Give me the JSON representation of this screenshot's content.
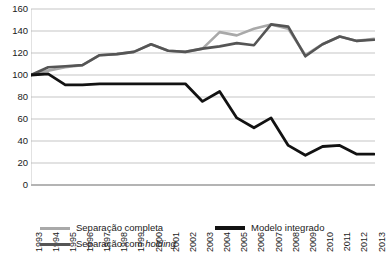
{
  "chart_data": {
    "type": "line",
    "title": "",
    "xlabel": "",
    "ylabel": "",
    "ylim": [
      0,
      160
    ],
    "ytick_step": 20,
    "yticks": [
      160,
      140,
      120,
      100,
      80,
      60,
      40,
      20,
      0
    ],
    "grid": true,
    "legend_position": "bottom-left",
    "categories": [
      "1993",
      "1994",
      "1995",
      "1996",
      "1997",
      "1998",
      "1999",
      "2000",
      "2001",
      "2002",
      "2003",
      "2004",
      "2005",
      "2006",
      "2007",
      "2008",
      "2009",
      "2010",
      "2011",
      "2012",
      "2013"
    ],
    "series": [
      {
        "name": "Separação completa",
        "color": "#a9a9a9",
        "width": 2.6,
        "values": [
          100,
          104,
          107,
          109,
          118,
          119,
          121,
          128,
          122,
          121,
          124,
          139,
          136,
          142,
          146,
          142,
          118,
          128,
          135,
          131,
          133
        ]
      },
      {
        "name": "Modelo integrado",
        "color": "#121212",
        "width": 2.8,
        "values": [
          100,
          101,
          91,
          91,
          92,
          92,
          92,
          92,
          92,
          92,
          76,
          85,
          61,
          52,
          61,
          36,
          27,
          35,
          36,
          28,
          28
        ]
      },
      {
        "name": "Separação com holding",
        "color": "#555555",
        "width": 2.6,
        "values": [
          100,
          107,
          108,
          109,
          118,
          119,
          121,
          128,
          122,
          121,
          124,
          126,
          129,
          127,
          146,
          144,
          117,
          128,
          135,
          131,
          132
        ]
      }
    ]
  },
  "legend": {
    "items": [
      {
        "label": "Separação completa",
        "label_italic": "",
        "color": "#a9a9a9",
        "thickness": "3px"
      },
      {
        "label": "Modelo integrado",
        "label_italic": "",
        "color": "#121212",
        "thickness": "4px"
      },
      {
        "label": "Separação com ",
        "label_italic": "holding",
        "color": "#555555",
        "thickness": "3px"
      }
    ]
  },
  "axis": {
    "y_ticks": [
      "160",
      "140",
      "120",
      "100",
      "80",
      "60",
      "40",
      "20",
      "0"
    ],
    "x_ticks": [
      "1993",
      "1994",
      "1995",
      "1996",
      "1997",
      "1998",
      "1999",
      "2000",
      "2001",
      "2002",
      "2003",
      "2004",
      "2005",
      "2006",
      "2007",
      "2008",
      "2009",
      "2010",
      "2011",
      "2012",
      "2013"
    ]
  },
  "caption": {
    "text": ""
  },
  "colors": {
    "grid": "#b6b6b6",
    "axis": "#6b6b6b",
    "background": "#ffffff",
    "series_light_gray": "#a9a9a9",
    "series_black": "#121212",
    "series_dark_gray": "#555555"
  }
}
